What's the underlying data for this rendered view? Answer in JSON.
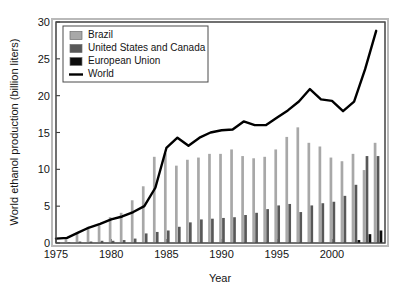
{
  "chart_data": {
    "type": "bar",
    "title": "",
    "subtitle": "",
    "xlabel": "Year",
    "ylabel": "World ethanol production (billion liters)",
    "xlim": [
      1975,
      2004.8
    ],
    "ylim": [
      0,
      30
    ],
    "ytick_labels": [
      "0",
      "5",
      "10",
      "15",
      "20",
      "25",
      "30"
    ],
    "yticks": [
      0,
      5,
      10,
      15,
      20,
      25,
      30
    ],
    "xtick_labels": [
      "1975",
      "1980",
      "1985",
      "1990",
      "1995",
      "2000"
    ],
    "xticks": [
      1975,
      1980,
      1985,
      1990,
      1995,
      2000
    ],
    "grid": false,
    "legend_position": "top-left",
    "categories": [
      1975,
      1976,
      1977,
      1978,
      1979,
      1980,
      1981,
      1982,
      1983,
      1984,
      1985,
      1986,
      1987,
      1988,
      1989,
      1990,
      1991,
      1992,
      1993,
      1994,
      1995,
      1996,
      1997,
      1998,
      1999,
      2000,
      2001,
      2002,
      2003,
      2004
    ],
    "series": [
      {
        "name": "Brazil",
        "type": "bar",
        "color": "#a8a8a8",
        "values": [
          0.0,
          0.6,
          1.4,
          2.2,
          2.4,
          3.5,
          4.1,
          5.8,
          7.7,
          11.7,
          12.2,
          10.5,
          11.3,
          11.6,
          12.1,
          12.1,
          12.7,
          11.8,
          11.5,
          11.7,
          12.7,
          14.4,
          15.7,
          13.6,
          13.1,
          11.6,
          11.1,
          12.1,
          9.9,
          13.6
        ]
      },
      {
        "name": "United States and Canada",
        "type": "bar",
        "color": "#585858",
        "values": [
          0.0,
          0.1,
          0.2,
          0.2,
          0.3,
          0.3,
          0.4,
          0.6,
          1.3,
          1.5,
          1.7,
          2.2,
          2.8,
          3.2,
          3.3,
          3.4,
          3.5,
          3.8,
          4.1,
          4.6,
          5.1,
          5.3,
          4.2,
          5.1,
          5.4,
          5.6,
          6.4,
          7.9,
          11.8,
          11.8
        ]
      },
      {
        "name": "European Union",
        "type": "bar",
        "color": "#0d0d0d",
        "values": [
          0.0,
          0.0,
          0.0,
          0.0,
          0.0,
          0.0,
          0.0,
          0.0,
          0.0,
          0.0,
          0.0,
          0.0,
          0.0,
          0.0,
          0.0,
          0.0,
          0.0,
          0.0,
          0.0,
          0.0,
          0.0,
          0.0,
          0.0,
          0.0,
          0.0,
          0.0,
          0.0,
          0.4,
          1.2,
          1.7
        ]
      },
      {
        "name": "World",
        "type": "line",
        "color": "#000000",
        "values": [
          0.6,
          0.7,
          1.4,
          2.1,
          2.6,
          3.2,
          3.6,
          4.2,
          5.0,
          7.5,
          12.9,
          14.3,
          13.2,
          14.3,
          15.0,
          15.3,
          15.4,
          16.5,
          16.0,
          16.0,
          17.0,
          18.0,
          19.2,
          20.9,
          19.5,
          19.3,
          17.9,
          19.2,
          23.6,
          28.8
        ]
      }
    ]
  },
  "legend": {
    "entries": [
      {
        "label": "Brazil",
        "marker": "swatch",
        "color": "#a8a8a8"
      },
      {
        "label": "United States and Canada",
        "marker": "swatch",
        "color": "#585858"
      },
      {
        "label": "European Union",
        "marker": "swatch",
        "color": "#0d0d0d"
      },
      {
        "label": "World",
        "marker": "line",
        "color": "#000000"
      }
    ]
  }
}
